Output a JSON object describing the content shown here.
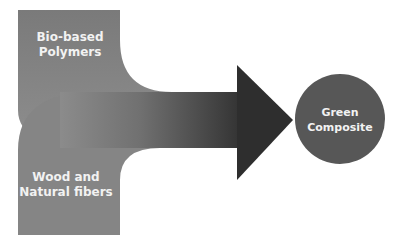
{
  "diagram": {
    "inputs": [
      {
        "label_line1": "Bio-based",
        "label_line2": "Polymers"
      },
      {
        "label_line1": "Wood and",
        "label_line2": "Natural fibers"
      }
    ],
    "output": {
      "label_line1": "Green",
      "label_line2": "Composite"
    },
    "colors": {
      "band_light": "#8a8a8a",
      "arrow_dark": "#2e2e2e",
      "circle": "#575757",
      "text": "#f2f2f2"
    }
  }
}
